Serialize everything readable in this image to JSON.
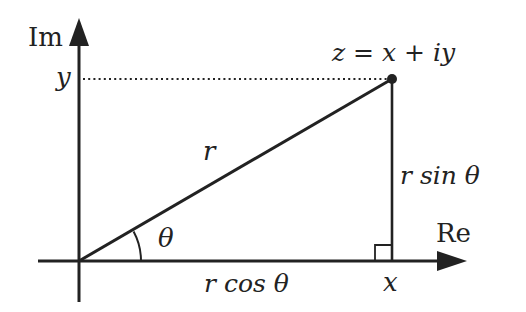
{
  "diagram": {
    "axes": {
      "imaginary_label": "Im",
      "real_label": "Re"
    },
    "point": {
      "label": "z = x + iy",
      "x_label": "x",
      "y_label": "y"
    },
    "segments": {
      "hypotenuse_label": "r",
      "adjacent_label": "r cos θ",
      "opposite_label": "r sin θ",
      "angle_label": "θ"
    },
    "colors": {
      "ink": "#222222",
      "background": "#ffffff"
    }
  }
}
